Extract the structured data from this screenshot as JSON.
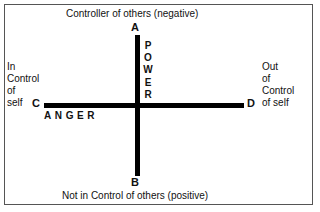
{
  "diagram": {
    "title_top": "Controller of others (negative)",
    "title_bottom": "Not in Control of others (positive)",
    "left_label_lines": [
      "In",
      "Control",
      "of",
      "self"
    ],
    "right_label_lines": [
      "Out",
      "of",
      "Control",
      "of self"
    ],
    "vertical_axis_label": "POWER",
    "vertical_axis_letters": [
      "P",
      "O",
      "W",
      "E",
      "R"
    ],
    "horizontal_axis_label": "ANGER",
    "horizontal_axis_letters": [
      "A",
      "N",
      "G",
      "E",
      "R"
    ],
    "horizontal_axis_label_spaced": "A N G E R",
    "endpoints": {
      "top": "A",
      "bottom": "B",
      "left": "C",
      "right": "D"
    },
    "colors": {
      "axis": "#000000",
      "border": "#555555",
      "background": "#ffffff",
      "text": "#111111"
    }
  }
}
